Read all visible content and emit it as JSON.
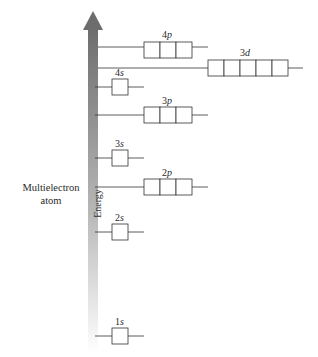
{
  "diagram": {
    "side_label_line1": "Multielectron",
    "side_label_line2": "atom",
    "axis_label": "Energy",
    "arrow_color_top": "#6d6d6d",
    "arrow_color_bottom": "#ffffff",
    "orbitals": [
      {
        "name": "1s",
        "n": "1",
        "l": "s",
        "boxes": 1
      },
      {
        "name": "2s",
        "n": "2",
        "l": "s",
        "boxes": 1
      },
      {
        "name": "2p",
        "n": "2",
        "l": "p",
        "boxes": 3
      },
      {
        "name": "3s",
        "n": "3",
        "l": "s",
        "boxes": 1
      },
      {
        "name": "3p",
        "n": "3",
        "l": "p",
        "boxes": 3
      },
      {
        "name": "4s",
        "n": "4",
        "l": "s",
        "boxes": 1
      },
      {
        "name": "3d",
        "n": "3",
        "l": "d",
        "boxes": 5
      },
      {
        "name": "4p",
        "n": "4",
        "l": "p",
        "boxes": 3
      }
    ]
  }
}
